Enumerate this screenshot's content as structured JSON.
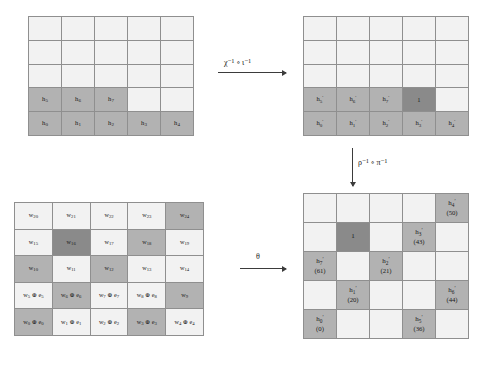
{
  "diagram": {
    "colors": {
      "cell_light": "#f2f2f2",
      "cell_mid": "#b2b2b2",
      "cell_dark": "#8a8a8a",
      "grid_line": "#8f8f8f",
      "arrow": "#3b3b3b"
    }
  },
  "arrows": [
    {
      "id": "tl-tr",
      "label": "χ⁻¹ ∘ ι⁻¹",
      "direction": "right"
    },
    {
      "id": "tr-br",
      "label": "ρ⁻¹ ∘ π⁻¹",
      "direction": "down"
    },
    {
      "id": "bl-br",
      "label": "θ",
      "direction": "right"
    }
  ],
  "grids": {
    "top_left": {
      "name": "state-grid-h",
      "rows": 5,
      "cols": 5,
      "cells": [
        {
          "label": "",
          "shade": "light"
        },
        {
          "label": "",
          "shade": "light"
        },
        {
          "label": "",
          "shade": "light"
        },
        {
          "label": "",
          "shade": "light"
        },
        {
          "label": "",
          "shade": "light"
        },
        {
          "label": "",
          "shade": "light"
        },
        {
          "label": "",
          "shade": "light"
        },
        {
          "label": "",
          "shade": "light"
        },
        {
          "label": "",
          "shade": "light"
        },
        {
          "label": "",
          "shade": "light"
        },
        {
          "label": "",
          "shade": "light"
        },
        {
          "label": "",
          "shade": "light"
        },
        {
          "label": "",
          "shade": "light"
        },
        {
          "label": "",
          "shade": "light"
        },
        {
          "label": "",
          "shade": "light"
        },
        {
          "label": "h₅",
          "base": "h",
          "sub": "5",
          "shade": "mid"
        },
        {
          "label": "h₆",
          "base": "h",
          "sub": "6",
          "shade": "mid"
        },
        {
          "label": "h₇",
          "base": "h",
          "sub": "7",
          "shade": "mid"
        },
        {
          "label": "",
          "shade": "light"
        },
        {
          "label": "",
          "shade": "light"
        },
        {
          "label": "h₀",
          "base": "h",
          "sub": "0",
          "shade": "mid"
        },
        {
          "label": "h₁",
          "base": "h",
          "sub": "1",
          "shade": "mid"
        },
        {
          "label": "h₂",
          "base": "h",
          "sub": "2",
          "shade": "mid"
        },
        {
          "label": "h₃",
          "base": "h",
          "sub": "3",
          "shade": "mid"
        },
        {
          "label": "h₄",
          "base": "h",
          "sub": "4",
          "shade": "mid"
        }
      ]
    },
    "top_right": {
      "name": "state-grid-h-prime",
      "rows": 5,
      "cols": 5,
      "cells": [
        {
          "label": "",
          "shade": "light"
        },
        {
          "label": "",
          "shade": "light"
        },
        {
          "label": "",
          "shade": "light"
        },
        {
          "label": "",
          "shade": "light"
        },
        {
          "label": "",
          "shade": "light"
        },
        {
          "label": "",
          "shade": "light"
        },
        {
          "label": "",
          "shade": "light"
        },
        {
          "label": "",
          "shade": "light"
        },
        {
          "label": "",
          "shade": "light"
        },
        {
          "label": "",
          "shade": "light"
        },
        {
          "label": "",
          "shade": "light"
        },
        {
          "label": "",
          "shade": "light"
        },
        {
          "label": "",
          "shade": "light"
        },
        {
          "label": "",
          "shade": "light"
        },
        {
          "label": "",
          "shade": "light"
        },
        {
          "label": "h₅′",
          "base": "h",
          "sub": "5",
          "prime": true,
          "shade": "mid"
        },
        {
          "label": "h₆′",
          "base": "h",
          "sub": "6",
          "prime": true,
          "shade": "mid"
        },
        {
          "label": "h₇′",
          "base": "h",
          "sub": "7",
          "prime": true,
          "shade": "mid"
        },
        {
          "label": "1",
          "base": "1",
          "shade": "dark"
        },
        {
          "label": "",
          "shade": "light"
        },
        {
          "label": "h₀′",
          "base": "h",
          "sub": "0",
          "prime": true,
          "shade": "mid"
        },
        {
          "label": "h₁′",
          "base": "h",
          "sub": "1",
          "prime": true,
          "shade": "mid"
        },
        {
          "label": "h₂′",
          "base": "h",
          "sub": "2",
          "prime": true,
          "shade": "mid"
        },
        {
          "label": "h₃′",
          "base": "h",
          "sub": "3",
          "prime": true,
          "shade": "mid"
        },
        {
          "label": "h₄′",
          "base": "h",
          "sub": "4",
          "prime": true,
          "shade": "mid"
        }
      ]
    },
    "bottom_left": {
      "name": "state-grid-w",
      "rows": 5,
      "cols": 5,
      "cells": [
        {
          "label": "w₂₀",
          "base": "w",
          "sub": "20",
          "shade": "light"
        },
        {
          "label": "w₂₁",
          "base": "w",
          "sub": "21",
          "shade": "light"
        },
        {
          "label": "w₂₂",
          "base": "w",
          "sub": "22",
          "shade": "light"
        },
        {
          "label": "w₂₃",
          "base": "w",
          "sub": "23",
          "shade": "light"
        },
        {
          "label": "w₂₄",
          "base": "w",
          "sub": "24",
          "shade": "mid"
        },
        {
          "label": "w₁₅",
          "base": "w",
          "sub": "15",
          "shade": "light"
        },
        {
          "label": "w₁₆",
          "base": "w",
          "sub": "16",
          "shade": "dark"
        },
        {
          "label": "w₁₇",
          "base": "w",
          "sub": "17",
          "shade": "light"
        },
        {
          "label": "w₁₈",
          "base": "w",
          "sub": "18",
          "shade": "mid"
        },
        {
          "label": "w₁₉",
          "base": "w",
          "sub": "19",
          "shade": "light"
        },
        {
          "label": "w₁₀",
          "base": "w",
          "sub": "10",
          "shade": "mid"
        },
        {
          "label": "w₁₁",
          "base": "w",
          "sub": "11",
          "shade": "light"
        },
        {
          "label": "w₁₂",
          "base": "w",
          "sub": "12",
          "shade": "mid"
        },
        {
          "label": "w₁₃",
          "base": "w",
          "sub": "13",
          "shade": "light"
        },
        {
          "label": "w₁₄",
          "base": "w",
          "sub": "14",
          "shade": "light"
        },
        {
          "label": "w₅ ⊕ e₅",
          "base": "w",
          "sub": "5",
          "xor": "e",
          "xorsub": "5",
          "shade": "light"
        },
        {
          "label": "w₆ ⊕ e₆",
          "base": "w",
          "sub": "6",
          "xor": "e",
          "xorsub": "6",
          "shade": "mid"
        },
        {
          "label": "w₇ ⊕ e₇",
          "base": "w",
          "sub": "7",
          "xor": "e",
          "xorsub": "7",
          "shade": "light"
        },
        {
          "label": "w₈ ⊕ e₈",
          "base": "w",
          "sub": "8",
          "xor": "e",
          "xorsub": "8",
          "shade": "light"
        },
        {
          "label": "w₉",
          "base": "w",
          "sub": "9",
          "shade": "mid"
        },
        {
          "label": "w₀ ⊕ e₀",
          "base": "w",
          "sub": "0",
          "xor": "e",
          "xorsub": "0",
          "shade": "mid"
        },
        {
          "label": "w₁ ⊕ e₁",
          "base": "w",
          "sub": "1",
          "xor": "e",
          "xorsub": "1",
          "shade": "light"
        },
        {
          "label": "w₂ ⊕ e₂",
          "base": "w",
          "sub": "2",
          "xor": "e",
          "xorsub": "2",
          "shade": "light"
        },
        {
          "label": "w₃ ⊕ e₃",
          "base": "w",
          "sub": "3",
          "xor": "e",
          "xorsub": "3",
          "shade": "mid"
        },
        {
          "label": "w₄ ⊕ e₄",
          "base": "w",
          "sub": "4",
          "xor": "e",
          "xorsub": "4",
          "shade": "light"
        }
      ]
    },
    "bottom_right": {
      "name": "state-grid-h-prime-indexed",
      "rows": 5,
      "cols": 5,
      "cells": [
        {
          "label": "",
          "shade": "light"
        },
        {
          "label": "",
          "shade": "light"
        },
        {
          "label": "",
          "shade": "light"
        },
        {
          "label": "",
          "shade": "light"
        },
        {
          "label": "h₄′",
          "base": "h",
          "sub": "4",
          "prime": true,
          "index": "(50)",
          "shade": "mid"
        },
        {
          "label": "",
          "shade": "light"
        },
        {
          "label": "1",
          "base": "1",
          "shade": "dark"
        },
        {
          "label": "",
          "shade": "light"
        },
        {
          "label": "h₃′",
          "base": "h",
          "sub": "3",
          "prime": true,
          "index": "(43)",
          "shade": "mid"
        },
        {
          "label": "",
          "shade": "light"
        },
        {
          "label": "h₇′",
          "base": "h",
          "sub": "7",
          "prime": true,
          "index": "(61)",
          "shade": "mid"
        },
        {
          "label": "",
          "shade": "light"
        },
        {
          "label": "h₂′",
          "base": "h",
          "sub": "2",
          "prime": true,
          "index": "(21)",
          "shade": "mid"
        },
        {
          "label": "",
          "shade": "light"
        },
        {
          "label": "",
          "shade": "light"
        },
        {
          "label": "",
          "shade": "light"
        },
        {
          "label": "h₁′",
          "base": "h",
          "sub": "1",
          "prime": true,
          "index": "(20)",
          "shade": "mid"
        },
        {
          "label": "",
          "shade": "light"
        },
        {
          "label": "",
          "shade": "light"
        },
        {
          "label": "h₆′",
          "base": "h",
          "sub": "6",
          "prime": true,
          "index": "(44)",
          "shade": "mid"
        },
        {
          "label": "h₀′",
          "base": "h",
          "sub": "0",
          "prime": true,
          "index": "(0)",
          "shade": "mid"
        },
        {
          "label": "",
          "shade": "light"
        },
        {
          "label": "",
          "shade": "light"
        },
        {
          "label": "h₅′",
          "base": "h",
          "sub": "5",
          "prime": true,
          "index": "(36)",
          "shade": "mid"
        },
        {
          "label": "",
          "shade": "light"
        }
      ]
    }
  }
}
